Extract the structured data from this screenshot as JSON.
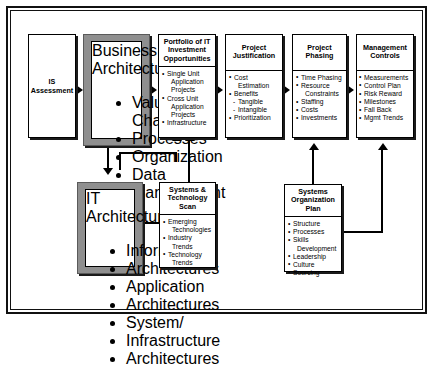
{
  "diagram": {
    "boxes": {
      "is_assessment": {
        "title": "IS\nAssessment",
        "line1": "IS",
        "line2": "Assessment"
      },
      "business_architectures": {
        "title": "Business Architectures",
        "title_line1": "Business",
        "title_line2": "Architectures",
        "items": [
          "Value Chains",
          "Processes",
          "Organization",
          "Data",
          "Management"
        ]
      },
      "portfolio": {
        "title": "Portfolio of IT Investment Opportunities",
        "title_line1": "Portfolio of IT",
        "title_line2": "Investment",
        "title_line3": "Opportunities",
        "items": [
          {
            "text": "Single Unit",
            "type": "bullet"
          },
          {
            "text": "Application",
            "type": "cont"
          },
          {
            "text": "Projects",
            "type": "cont"
          },
          {
            "text": "Cross Unit",
            "type": "bullet"
          },
          {
            "text": "Application",
            "type": "cont"
          },
          {
            "text": "Projects",
            "type": "cont"
          },
          {
            "text": "Infrastructure",
            "type": "bullet"
          }
        ]
      },
      "project_justification": {
        "title": "Project Justification",
        "title_line1": "Project",
        "title_line2": "Justification",
        "items": [
          {
            "text": "Cost",
            "type": "bullet"
          },
          {
            "text": "Estimation",
            "type": "cont"
          },
          {
            "text": "Benefits",
            "type": "bullet"
          },
          {
            "text": "Tangible",
            "type": "sub"
          },
          {
            "text": "Intangible",
            "type": "sub"
          },
          {
            "text": "Prioritization",
            "type": "bullet"
          }
        ]
      },
      "project_phasing": {
        "title": "Project Phasing",
        "title_line1": "Project",
        "title_line2": "Phasing",
        "items": [
          {
            "text": "Time Phasing",
            "type": "bullet"
          },
          {
            "text": "Resource",
            "type": "bullet"
          },
          {
            "text": "Constraints",
            "type": "cont"
          },
          {
            "text": "Staffing",
            "type": "bullet"
          },
          {
            "text": "Costs",
            "type": "bullet"
          },
          {
            "text": "Investments",
            "type": "bullet"
          }
        ]
      },
      "management_controls": {
        "title": "Management Controls",
        "title_line1": "Management",
        "title_line2": "Controls",
        "items": [
          "Measurements",
          "Control Plan",
          "Risk Reward",
          "Milestones",
          "Fall Back",
          "Mgmt Trends"
        ]
      },
      "it_architectures": {
        "title": "IT Architectures",
        "title_line1": "IT",
        "title_line2": "Architectures",
        "items": [
          {
            "text": "Information",
            "type": "bullet"
          },
          {
            "text": "Architectures",
            "type": "cont"
          },
          {
            "text": "Application",
            "type": "bullet"
          },
          {
            "text": "Architectures",
            "type": "cont"
          },
          {
            "text": "System/",
            "type": "bullet"
          },
          {
            "text": "Infrastructure",
            "type": "cont"
          },
          {
            "text": "Architectures",
            "type": "cont"
          }
        ]
      },
      "tech_scan": {
        "title": "Systems & Technology Scan",
        "title_line1": "Systems &",
        "title_line2": "Technology",
        "title_line3": "Scan",
        "items": [
          {
            "text": "Emerging",
            "type": "bullet"
          },
          {
            "text": "Technologies",
            "type": "cont"
          },
          {
            "text": "Industry",
            "type": "bullet"
          },
          {
            "text": "Trends",
            "type": "cont"
          },
          {
            "text": "Technology",
            "type": "bullet"
          },
          {
            "text": "Trends",
            "type": "cont"
          }
        ]
      },
      "systems_org_plan": {
        "title": "Systems Organization Plan",
        "title_line1": "Systems",
        "title_line2": "Organization",
        "title_line3": "Plan",
        "items": [
          {
            "text": "Structure",
            "type": "bullet"
          },
          {
            "text": "Processes",
            "type": "bullet"
          },
          {
            "text": "Skills",
            "type": "bullet"
          },
          {
            "text": "Development",
            "type": "cont"
          },
          {
            "text": "Leadership",
            "type": "bullet"
          },
          {
            "text": "Culture",
            "type": "bullet"
          },
          {
            "text": "Sourcing",
            "type": "bullet"
          }
        ]
      }
    },
    "colors": {
      "emphasis_frame": "#8f8f8f",
      "line": "#000000",
      "background": "#ffffff"
    }
  }
}
